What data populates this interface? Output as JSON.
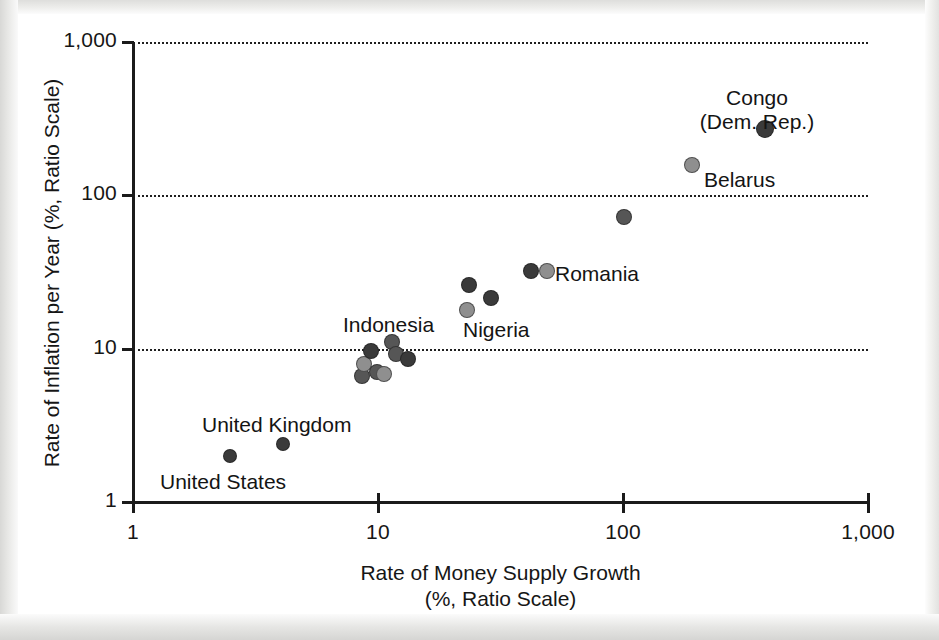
{
  "figure": {
    "background_color": "#ffffff",
    "ink_color": "#161616"
  },
  "axes": {
    "x": {
      "title_line1": "Rate of Money Supply Growth",
      "title_line2": "(%, Ratio Scale)",
      "scale": "log",
      "ticks": [
        "1",
        "10",
        "100",
        "1,000"
      ],
      "tick_values": [
        1,
        10,
        100,
        1000
      ],
      "range": [
        1,
        1000
      ]
    },
    "y": {
      "title": "Rate of Inflation per Year (%, Ratio Scale)",
      "scale": "log",
      "ticks": [
        "1",
        "10",
        "100",
        "1,000"
      ],
      "tick_values": [
        1,
        10,
        100,
        1000
      ],
      "range": [
        1,
        1000
      ]
    }
  },
  "chart_data": {
    "type": "scatter",
    "title": "",
    "xlabel": "Rate of Money Supply Growth (%, Ratio Scale)",
    "ylabel": "Rate of Inflation per Year (%, Ratio Scale)",
    "xscale": "log",
    "yscale": "log",
    "xlim": [
      1,
      1000
    ],
    "ylim": [
      1,
      1000
    ],
    "xticks": [
      1,
      10,
      100,
      1000
    ],
    "xticklabels": [
      "1",
      "10",
      "100",
      "1,000"
    ],
    "yticks": [
      1,
      10,
      100,
      1000
    ],
    "yticklabels": [
      "1",
      "10",
      "100",
      "1,000"
    ],
    "grid": "horizontal-dotted",
    "legend": "none",
    "marker_shape": "circle",
    "marker_colors": {
      "dark": "#3a3a3a",
      "medium": "#565656",
      "light": "#8f8f8f"
    },
    "points": [
      {
        "label": "United States",
        "x": 2.5,
        "y": 2.0,
        "shade": "dark",
        "r": 7
      },
      {
        "label": "United Kingdom",
        "x": 4.1,
        "y": 2.4,
        "shade": "dark",
        "r": 7
      },
      {
        "label": "",
        "x": 8.6,
        "y": 6.6,
        "shade": "medium",
        "r": 8
      },
      {
        "label": "",
        "x": 8.8,
        "y": 8.0,
        "shade": "light",
        "r": 8
      },
      {
        "label": "Indonesia",
        "x": 9.4,
        "y": 9.6,
        "shade": "dark",
        "r": 8
      },
      {
        "label": "",
        "x": 9.9,
        "y": 7.0,
        "shade": "medium",
        "r": 8
      },
      {
        "label": "",
        "x": 10.6,
        "y": 6.8,
        "shade": "light",
        "r": 8
      },
      {
        "label": "",
        "x": 11.4,
        "y": 11.0,
        "shade": "medium",
        "r": 8
      },
      {
        "label": "",
        "x": 11.8,
        "y": 9.2,
        "shade": "medium",
        "r": 8
      },
      {
        "label": "",
        "x": 13.2,
        "y": 8.6,
        "shade": "dark",
        "r": 8
      },
      {
        "label": "Nigeria",
        "x": 23.0,
        "y": 18.0,
        "shade": "light",
        "r": 8
      },
      {
        "label": "",
        "x": 23.5,
        "y": 26.0,
        "shade": "dark",
        "r": 8
      },
      {
        "label": "",
        "x": 29.0,
        "y": 21.5,
        "shade": "dark",
        "r": 8
      },
      {
        "label": "",
        "x": 42.0,
        "y": 32.0,
        "shade": "dark",
        "r": 8
      },
      {
        "label": "Romania",
        "x": 49.0,
        "y": 32.0,
        "shade": "light",
        "r": 8
      },
      {
        "label": "",
        "x": 101.0,
        "y": 72.0,
        "shade": "medium",
        "r": 8
      },
      {
        "label": "Belarus",
        "x": 192.0,
        "y": 158.0,
        "shade": "light",
        "r": 8
      },
      {
        "label": "Congo (Dem. Rep.)",
        "x": 380.0,
        "y": 270.0,
        "shade": "dark",
        "r": 9
      }
    ],
    "annotations": [
      {
        "text": "Congo",
        "x": 757,
        "y": 86,
        "anchor": "center"
      },
      {
        "text": "(Dem. Rep.)",
        "x": 757,
        "y": 110,
        "anchor": "center"
      },
      {
        "text": "Belarus",
        "x": 704,
        "y": 168,
        "anchor": "left"
      },
      {
        "text": "Romania",
        "x": 555,
        "y": 262,
        "anchor": "left"
      },
      {
        "text": "Nigeria",
        "x": 463,
        "y": 318,
        "anchor": "left"
      },
      {
        "text": "Indonesia",
        "x": 343,
        "y": 313,
        "anchor": "left"
      },
      {
        "text": "United Kingdom",
        "x": 202,
        "y": 413,
        "anchor": "left"
      },
      {
        "text": "United States",
        "x": 160,
        "y": 470,
        "anchor": "left"
      }
    ]
  },
  "geometry": {
    "plot_left": 133,
    "plot_right": 868,
    "plot_top": 42,
    "plot_bottom": 502
  }
}
